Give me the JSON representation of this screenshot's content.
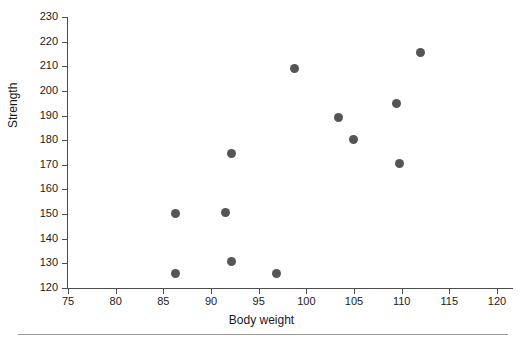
{
  "chart_data": {
    "type": "scatter",
    "title": "",
    "xlabel": "Body weight",
    "ylabel": "Strength",
    "xlim": [
      75,
      120
    ],
    "ylim": [
      120,
      230
    ],
    "xticks": [
      75,
      80,
      85,
      90,
      95,
      100,
      105,
      110,
      115,
      120
    ],
    "yticks": [
      120,
      130,
      140,
      150,
      160,
      170,
      180,
      190,
      200,
      210,
      220,
      230
    ],
    "xtick_labels": [
      "75",
      "80",
      "85",
      "90",
      "95",
      "100",
      "105",
      "110",
      "115",
      "120"
    ],
    "ytick_labels": [
      "120",
      "130",
      "140",
      "150",
      "160",
      "170",
      "180",
      "190",
      "200",
      "210",
      "220",
      "230"
    ],
    "grid": false,
    "legend": false,
    "marker": "filled-circle",
    "marker_color": "#555555",
    "axis_color": "#4d4d4d",
    "background": "#ffffff",
    "points": [
      {
        "x": 86.3,
        "y": 126.0
      },
      {
        "x": 86.3,
        "y": 150.2
      },
      {
        "x": 91.5,
        "y": 150.6
      },
      {
        "x": 92.2,
        "y": 130.8
      },
      {
        "x": 92.2,
        "y": 174.6
      },
      {
        "x": 96.9,
        "y": 126.0
      },
      {
        "x": 98.8,
        "y": 209.0
      },
      {
        "x": 103.4,
        "y": 189.2
      },
      {
        "x": 104.9,
        "y": 180.2
      },
      {
        "x": 109.5,
        "y": 194.8
      },
      {
        "x": 109.8,
        "y": 170.6
      },
      {
        "x": 112.0,
        "y": 215.4
      }
    ]
  }
}
